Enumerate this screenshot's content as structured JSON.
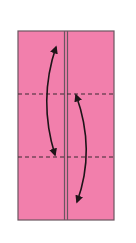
{
  "diagram": {
    "type": "origami-fold-step",
    "paper_color": "#f27fac",
    "border_color": "#6b5560",
    "line_color": "#3a2a30",
    "valley_folds": 2,
    "center_crease": true,
    "arrows": [
      {
        "name": "fold-up-arrow-left",
        "direction": "bidirectional"
      },
      {
        "name": "fold-arrow-right",
        "direction": "bidirectional"
      }
    ]
  }
}
